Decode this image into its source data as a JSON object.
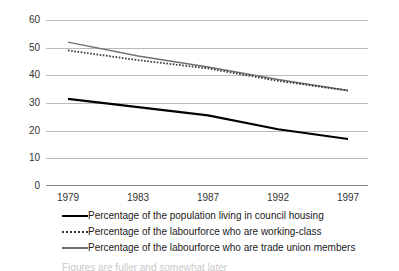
{
  "chart_data": {
    "type": "line",
    "title": "",
    "xlabel": "",
    "ylabel": "",
    "x": [
      "1979",
      "1983",
      "1987",
      "1992",
      "1997"
    ],
    "categories": [
      "1979",
      "1983",
      "1987",
      "1992",
      "1997"
    ],
    "ylim": [
      0,
      60
    ],
    "y_ticks": [
      "0",
      "10",
      "20",
      "30",
      "40",
      "50",
      "60"
    ],
    "grid": true,
    "legend_position": "bottom",
    "series": [
      {
        "name": "Percentage of the population living in council housing",
        "values": [
          31.5,
          28.5,
          25.5,
          20.5,
          17.0
        ],
        "style": "solid",
        "color": "#000000",
        "width": 2.2
      },
      {
        "name": "Percentage of the labourforce who are working-class",
        "values": [
          49.0,
          45.5,
          42.5,
          38.0,
          34.5
        ],
        "style": "dotted",
        "color": "#3a3a3a",
        "width": 1.8
      },
      {
        "name": "Percentage of the labourforce who are trade union members",
        "values": [
          52.0,
          47.0,
          43.0,
          38.5,
          34.5
        ],
        "style": "solid",
        "color": "#707070",
        "width": 1.4
      }
    ]
  },
  "axes": {
    "y_ticks": [
      "60",
      "50",
      "40",
      "30",
      "20",
      "10",
      "0"
    ],
    "x_ticks": [
      "1979",
      "1983",
      "1987",
      "1992",
      "1997"
    ]
  },
  "legend": {
    "items": [
      {
        "label": "Percentage of the population living in council housing",
        "swatch": "solid-black-line-icon"
      },
      {
        "label": "Percentage of the labourforce who are working-class",
        "swatch": "dotted-line-icon"
      },
      {
        "label": "Percentage of the labourforce who are trade union members",
        "swatch": "solid-grey-line-icon"
      }
    ]
  },
  "footnote": {
    "text": "Figures are fuller and somewhat later"
  },
  "colors": {
    "grid": "#b9b9b9",
    "axis": "#8a8a8a",
    "series_black": "#000000",
    "series_dotted": "#3a3a3a",
    "series_grey": "#707070",
    "text": "#1a1a1a"
  }
}
